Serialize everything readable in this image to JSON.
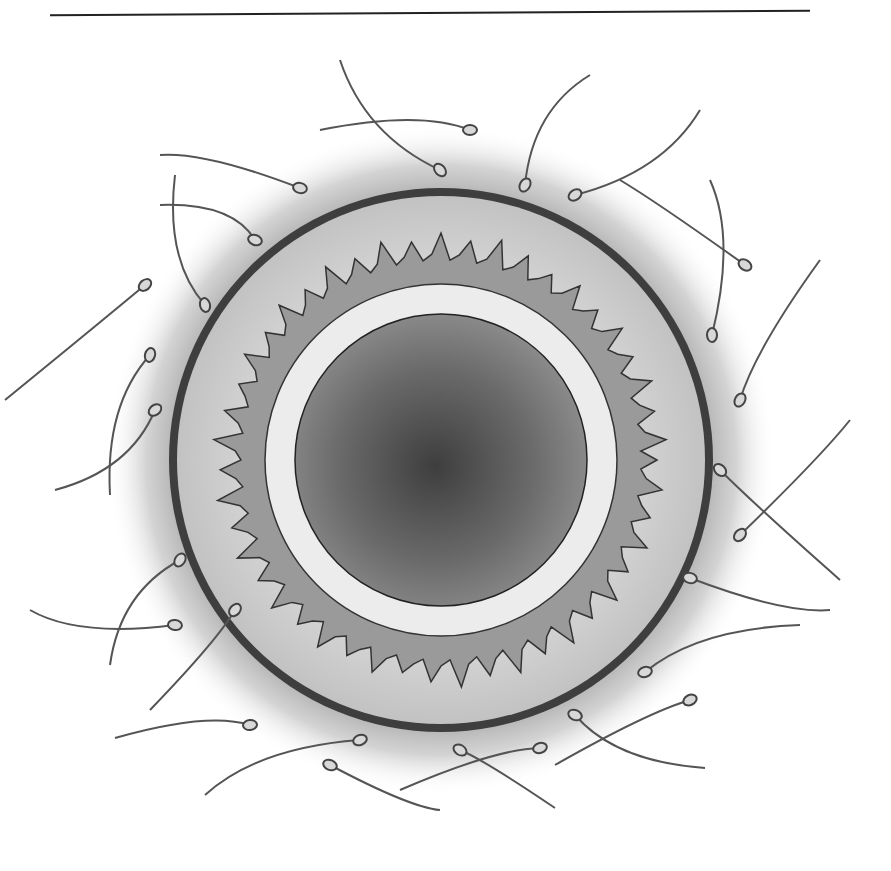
{
  "figure": {
    "colors": {
      "background": "#ffffff",
      "halo": "#b9b9b9",
      "outer_membrane": "#4a4a4a",
      "zona": "#cfcfcf",
      "spiky_layer": "#9a9a9a",
      "inner_ring": "#ececec",
      "cytoplasm_edge": "#8c8c8c",
      "cytoplasm_center": "#3e3e3e",
      "sperm": "#555555"
    },
    "center": [
      441,
      460
    ],
    "radii": {
      "halo": 330,
      "outer": 270,
      "zona": 258,
      "spiky": 210,
      "ring": 175,
      "cytoplasm": 145
    }
  }
}
